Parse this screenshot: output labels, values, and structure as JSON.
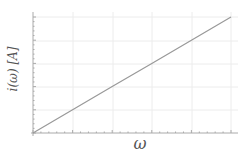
{
  "chart_data": {
    "type": "line",
    "title": "",
    "xlabel": "ω",
    "ylabel": "i(ω) [A]",
    "grid": true,
    "legend": null,
    "x": [
      0,
      1,
      2,
      3,
      4,
      5
    ],
    "series": [
      {
        "name": "i(ω)",
        "values": [
          0,
          1,
          2,
          3,
          4,
          5
        ],
        "color": "#999999"
      }
    ],
    "xlim": [
      0,
      5
    ],
    "ylim": [
      0,
      5
    ],
    "tick_labels_shown": false
  },
  "labels": {
    "xlabel": "ω",
    "ylabel": "i(ω) [A]"
  }
}
